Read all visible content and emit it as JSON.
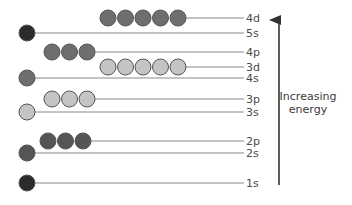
{
  "diagram": {
    "title": "",
    "axis_label_line1": "Increasing",
    "axis_label_line2": "energy",
    "colors": {
      "near_black": "#2b2b2b",
      "dark_gray": "#555555",
      "mid_gray": "#6e6e6e",
      "light_gray": "#c4c4c4",
      "line": "#8a8a8a",
      "arrow": "#333333"
    },
    "levels": [
      {
        "name": "1s",
        "orbitals": 1,
        "color": "near_black"
      },
      {
        "name": "2s",
        "orbitals": 1,
        "color": "dark_gray"
      },
      {
        "name": "2p",
        "orbitals": 3,
        "color": "dark_gray"
      },
      {
        "name": "3s",
        "orbitals": 1,
        "color": "light_gray"
      },
      {
        "name": "3p",
        "orbitals": 3,
        "color": "light_gray"
      },
      {
        "name": "4s",
        "orbitals": 1,
        "color": "mid_gray"
      },
      {
        "name": "3d",
        "orbitals": 5,
        "color": "light_gray"
      },
      {
        "name": "4p",
        "orbitals": 3,
        "color": "mid_gray"
      },
      {
        "name": "5s",
        "orbitals": 1,
        "color": "near_black"
      },
      {
        "name": "4d",
        "orbitals": 5,
        "color": "mid_gray"
      }
    ]
  }
}
